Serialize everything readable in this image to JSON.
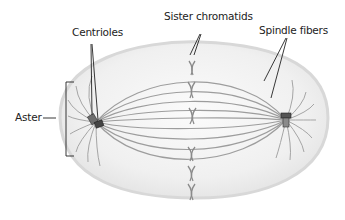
{
  "diagram": {
    "type": "biology-cell-mitosis-metaphase",
    "labels": {
      "centrioles": "Centrioles",
      "sister_chromatids": "Sister chromatids",
      "spindle_fibers": "Spindle fibers",
      "aster": "Aster"
    },
    "structures": {
      "cell": "cell membrane (oval)",
      "left_centriole": "centriole pair (left pole)",
      "right_centriole": "centriole pair (right pole)",
      "chromatids_count": 6,
      "spindle_fibers": "fibers from pole to pole",
      "aster_rays": "short radiating fibers around each centriole"
    },
    "colors": {
      "cell_fill": "#ececec",
      "cell_edge": "#d6d6d6",
      "fiber": "#9a9a9a",
      "chromatid": "#8a8a8a",
      "leader_line": "#222222",
      "label_text": "#222222"
    }
  }
}
